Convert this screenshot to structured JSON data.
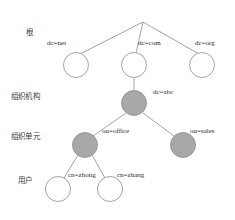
{
  "diagram": {
    "type": "ldap-directory-information-tree",
    "palette": {
      "background": "#ffffff",
      "edge": "#8d8d8d",
      "node_stroke": "#8d8d8d",
      "node_fill_empty": "#ffffff",
      "node_fill_shaded": "#a8a8a8",
      "text": "#2b2b2b",
      "tier_text": "#3a3a3a"
    },
    "tiers": [
      {
        "id": "root",
        "label": "根",
        "x": 26,
        "y": 29
      },
      {
        "id": "organization",
        "label": "组织机构",
        "x": 11,
        "y": 93
      },
      {
        "id": "org-unit",
        "label": "组织单元",
        "x": 11,
        "y": 133
      },
      {
        "id": "user",
        "label": "用户",
        "x": 18,
        "y": 177
      }
    ],
    "apex": {
      "x": 143,
      "y": 22
    },
    "nodes": [
      {
        "id": "dc-net",
        "label": "dc=net",
        "cx": 76,
        "cy": 65,
        "r": 12.5,
        "fill": "empty",
        "label_x": 47,
        "label_y": 40
      },
      {
        "id": "dc-com",
        "label": "dc=com",
        "cx": 134,
        "cy": 65,
        "r": 12.5,
        "fill": "empty",
        "label_x": 138,
        "label_y": 40
      },
      {
        "id": "dc-org",
        "label": "dc=org",
        "cx": 202,
        "cy": 65,
        "r": 12.5,
        "fill": "empty",
        "label_x": 195,
        "label_y": 40
      },
      {
        "id": "dc-abc",
        "label": "dc=abc",
        "cx": 134,
        "cy": 103,
        "r": 12.5,
        "fill": "shaded",
        "label_x": 153,
        "label_y": 89
      },
      {
        "id": "ou-office",
        "label": "ou=office",
        "cx": 85,
        "cy": 145,
        "r": 12.5,
        "fill": "shaded",
        "label_x": 102,
        "label_y": 128
      },
      {
        "id": "ou-sales",
        "label": "ou=sales",
        "cx": 183,
        "cy": 145,
        "r": 12.5,
        "fill": "shaded",
        "label_x": 190,
        "label_y": 128
      },
      {
        "id": "cn-zhong",
        "label": "cn=zhong",
        "cx": 58,
        "cy": 189,
        "r": 12.5,
        "fill": "empty",
        "label_x": 68,
        "label_y": 172
      },
      {
        "id": "cn-zhang",
        "label": "cn=zhang",
        "cx": 110,
        "cy": 189,
        "r": 12.5,
        "fill": "empty",
        "label_x": 117,
        "label_y": 172
      }
    ],
    "edges": [
      {
        "id": "apex-to-dc-net",
        "x1": 143,
        "y1": 22,
        "x2": 80,
        "y2": 54
      },
      {
        "id": "apex-to-dc-com",
        "x1": 143,
        "y1": 22,
        "x2": 136,
        "y2": 53
      },
      {
        "id": "apex-to-dc-org",
        "x1": 143,
        "y1": 22,
        "x2": 199,
        "y2": 54
      },
      {
        "id": "dc-com-to-dc-abc",
        "x1": 134,
        "y1": 78,
        "x2": 134,
        "y2": 90
      },
      {
        "id": "dc-abc-to-ou-office",
        "x1": 126,
        "y1": 113,
        "x2": 93,
        "y2": 136
      },
      {
        "id": "dc-abc-to-ou-sales",
        "x1": 143,
        "y1": 113,
        "x2": 174,
        "y2": 136
      },
      {
        "id": "ou-office-to-cn-zhong",
        "x1": 78,
        "y1": 155,
        "x2": 64,
        "y2": 178
      },
      {
        "id": "ou-office-to-cn-zhang",
        "x1": 92,
        "y1": 155,
        "x2": 105,
        "y2": 178
      }
    ]
  }
}
